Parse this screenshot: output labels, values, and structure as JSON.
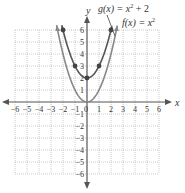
{
  "chart_data": {
    "type": "line",
    "title": "",
    "xlabel": "x",
    "ylabel": "y",
    "xlim": [
      -6,
      6
    ],
    "ylim": [
      -6,
      6
    ],
    "grid": true,
    "x_ticks": [
      "-6",
      "-5",
      "-4",
      "-3",
      "-2",
      "-1",
      "0",
      "1",
      "2",
      "3",
      "4",
      "5",
      "6"
    ],
    "y_ticks": [
      "-6",
      "-5",
      "-4",
      "-3",
      "-2",
      "-1",
      "1",
      "2",
      "3",
      "4",
      "5",
      "6"
    ],
    "series": [
      {
        "name": "g(x) = x² + 2",
        "label_base": "g(x) = x",
        "label_tail": " + 2",
        "color": "#555555",
        "points": [
          [
            -2,
            6
          ],
          [
            -1,
            3
          ],
          [
            0,
            2
          ],
          [
            1,
            3
          ],
          [
            2,
            6
          ]
        ]
      },
      {
        "name": "f(x) = x²",
        "label_base": "f(x) = x",
        "label_tail": "",
        "color": "#888888",
        "points": []
      }
    ]
  },
  "labels": {
    "x_axis": "x",
    "y_axis": "y",
    "g_label": "g(x) = x",
    "g_tail": " + 2",
    "f_label": "f(x) = x",
    "exponent": "2"
  }
}
